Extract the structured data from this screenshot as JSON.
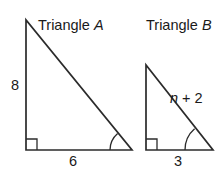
{
  "figure": {
    "type": "geometry-diagram",
    "background_color": "#ffffff",
    "stroke_color": "#2b2b2b",
    "text_color": "#1a1a1a",
    "triangles": [
      {
        "id": "triangle-a",
        "title_prefix": "Triangle ",
        "title_variable": "A",
        "title_full": "Triangle A",
        "vertical_leg_label": "8",
        "horizontal_leg_label": "6",
        "hypotenuse_label": "",
        "has_right_angle_mark": true,
        "has_angle_arc": true,
        "geometry": {
          "apex": {
            "x": 26,
            "y": 20
          },
          "right_angle": {
            "x": 26,
            "y": 150
          },
          "base_end": {
            "x": 132,
            "y": 150
          }
        }
      },
      {
        "id": "triangle-b",
        "title_prefix": "Triangle ",
        "title_variable": "B",
        "title_full": "Triangle B",
        "vertical_leg_label": "",
        "horizontal_leg_label": "3",
        "hypotenuse_label_prefix": "",
        "hypotenuse_variable": "n",
        "hypotenuse_label_suffix": " + 2",
        "hypotenuse_label_full": "n + 2",
        "has_right_angle_mark": true,
        "has_angle_arc": true,
        "geometry": {
          "apex": {
            "x": 146,
            "y": 65
          },
          "right_angle": {
            "x": 146,
            "y": 150
          },
          "base_end": {
            "x": 213,
            "y": 150
          }
        }
      }
    ]
  }
}
